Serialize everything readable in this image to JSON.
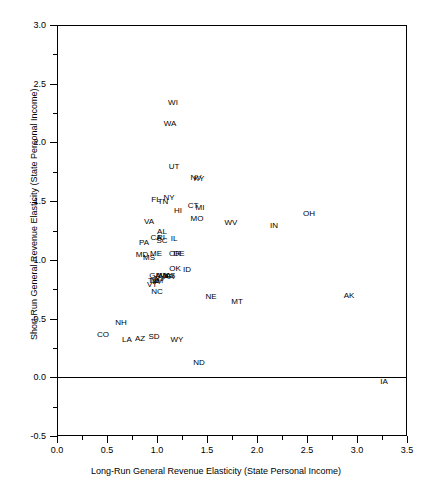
{
  "chart_data": {
    "type": "scatter",
    "title": "",
    "xlabel": "Long-Run General Revenue Elasticity (State Personal Income)",
    "ylabel": "Short-Run General Revenue Elasticity (State Personal Income)",
    "xlim": [
      0.0,
      3.5
    ],
    "ylim": [
      -0.5,
      3.0
    ],
    "xticks": [
      "0.0",
      "0.5",
      "1.0",
      "1.5",
      "2.0",
      "2.5",
      "3.0",
      "3.5"
    ],
    "xtick_values": [
      0.0,
      0.5,
      1.0,
      1.5,
      2.0,
      2.5,
      3.0,
      3.5
    ],
    "yticks": [
      "-0.5",
      "0.0",
      "0.5",
      "1.0",
      "1.5",
      "2.0",
      "2.5",
      "3.0"
    ],
    "ytick_values": [
      -0.5,
      0.0,
      0.5,
      1.0,
      1.5,
      2.0,
      2.5,
      3.0
    ],
    "grid": false,
    "legend": "none",
    "marker_style": "text-label",
    "annotations": [
      {
        "label": "zero-reference-line",
        "type": "hline",
        "y": 0.0
      }
    ],
    "points": [
      {
        "label": "WI",
        "x": 1.16,
        "y": 2.34
      },
      {
        "label": "WA",
        "x": 1.13,
        "y": 2.16
      },
      {
        "label": "UT",
        "x": 1.17,
        "y": 1.79
      },
      {
        "label": "NV",
        "x": 1.39,
        "y": 1.7
      },
      {
        "label": "KY",
        "x": 1.42,
        "y": 1.69
      },
      {
        "label": "FL",
        "x": 0.99,
        "y": 1.51
      },
      {
        "label": "TN",
        "x": 1.06,
        "y": 1.49
      },
      {
        "label": "NY",
        "x": 1.12,
        "y": 1.53
      },
      {
        "label": "CT",
        "x": 1.36,
        "y": 1.46
      },
      {
        "label": "MI",
        "x": 1.43,
        "y": 1.44
      },
      {
        "label": "HI",
        "x": 1.21,
        "y": 1.42
      },
      {
        "label": "MO",
        "x": 1.4,
        "y": 1.35
      },
      {
        "label": "OH",
        "x": 2.52,
        "y": 1.39
      },
      {
        "label": "WV",
        "x": 1.74,
        "y": 1.31
      },
      {
        "label": "IN",
        "x": 2.17,
        "y": 1.29
      },
      {
        "label": "VA",
        "x": 0.92,
        "y": 1.32
      },
      {
        "label": "AL",
        "x": 1.05,
        "y": 1.24
      },
      {
        "label": "CA",
        "x": 0.99,
        "y": 1.19
      },
      {
        "label": "RI",
        "x": 1.04,
        "y": 1.19
      },
      {
        "label": "SC",
        "x": 1.05,
        "y": 1.16
      },
      {
        "label": "IL",
        "x": 1.17,
        "y": 1.18
      },
      {
        "label": "PA",
        "x": 0.87,
        "y": 1.14
      },
      {
        "label": "MD",
        "x": 0.85,
        "y": 1.04
      },
      {
        "label": "MS",
        "x": 0.92,
        "y": 1.02
      },
      {
        "label": "ME",
        "x": 0.99,
        "y": 1.05
      },
      {
        "label": "OR",
        "x": 1.18,
        "y": 1.05
      },
      {
        "label": "DE",
        "x": 1.22,
        "y": 1.05
      },
      {
        "label": "OK",
        "x": 1.18,
        "y": 0.92
      },
      {
        "label": "ID",
        "x": 1.3,
        "y": 0.91
      },
      {
        "label": "GA",
        "x": 0.98,
        "y": 0.86
      },
      {
        "label": "MN",
        "x": 1.05,
        "y": 0.86
      },
      {
        "label": "MA",
        "x": 1.08,
        "y": 0.86
      },
      {
        "label": "AR",
        "x": 1.12,
        "y": 0.85
      },
      {
        "label": "KS",
        "x": 1.13,
        "y": 0.86
      },
      {
        "label": "NJ",
        "x": 1.02,
        "y": 0.84
      },
      {
        "label": "TX",
        "x": 0.96,
        "y": 0.82
      },
      {
        "label": "NM",
        "x": 1.0,
        "y": 0.82
      },
      {
        "label": "IA",
        "x": 0.99,
        "y": 0.81
      },
      {
        "label": "VT",
        "x": 0.95,
        "y": 0.79
      },
      {
        "label": "NC",
        "x": 1.0,
        "y": 0.73
      },
      {
        "label": "NE",
        "x": 1.54,
        "y": 0.68
      },
      {
        "label": "MT",
        "x": 1.8,
        "y": 0.64
      },
      {
        "label": "AK",
        "x": 2.92,
        "y": 0.69
      },
      {
        "label": "NH",
        "x": 0.64,
        "y": 0.46
      },
      {
        "label": "CO",
        "x": 0.46,
        "y": 0.36
      },
      {
        "label": "LA",
        "x": 0.7,
        "y": 0.32
      },
      {
        "label": "AZ",
        "x": 0.83,
        "y": 0.33
      },
      {
        "label": "SD",
        "x": 0.97,
        "y": 0.34
      },
      {
        "label": "WY",
        "x": 1.2,
        "y": 0.32
      },
      {
        "label": "ND",
        "x": 1.42,
        "y": 0.12
      },
      {
        "label": "IA2",
        "display": "IA",
        "x": 3.27,
        "y": -0.04
      }
    ]
  }
}
